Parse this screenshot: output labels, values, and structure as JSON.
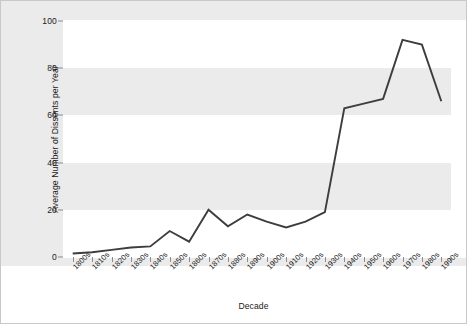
{
  "chart_data": {
    "type": "line",
    "title": "",
    "xlabel": "Decade",
    "ylabel": "Average Number of Dissents per Year",
    "categories": [
      "1800s",
      "1810s",
      "1820s",
      "1830s",
      "1840s",
      "1850s",
      "1860s",
      "1870s",
      "1880s",
      "1890s",
      "1900s",
      "1910s",
      "1920s",
      "1930s",
      "1940s",
      "1950s",
      "1960s",
      "1970s",
      "1980s",
      "1990s"
    ],
    "values": [
      1.5,
      2,
      3,
      4,
      4.5,
      11,
      6.5,
      20,
      13,
      18,
      15,
      12.5,
      15,
      19,
      63,
      65,
      67,
      92,
      90,
      66
    ],
    "series": [
      {
        "name": "Average Number of Dissents per Year",
        "values": [
          1.5,
          2,
          3,
          4,
          4.5,
          11,
          6.5,
          20,
          13,
          18,
          15,
          12.5,
          15,
          19,
          63,
          65,
          67,
          92,
          90,
          66
        ]
      }
    ],
    "ylim": [
      0,
      100
    ],
    "yticks": [
      0,
      20,
      40,
      60,
      80,
      100
    ],
    "ytick_labels": [
      "0",
      "20",
      "40",
      "60",
      "80",
      "100"
    ],
    "grid": "horizontal-bands",
    "legend": "none",
    "line_color": "#3d3d3d",
    "band_color": "#ebebeb",
    "plot_background": "#ffffff",
    "border_color": "#c8c8c8"
  }
}
